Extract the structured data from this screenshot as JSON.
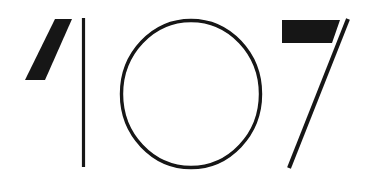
{
  "artwork": {
    "title": "107",
    "kind": "stylized-numeral-graphic",
    "reading": "107",
    "background_color": "#ffffff",
    "ink_color": "#161616",
    "canvas": {
      "width": 368,
      "height": 172
    },
    "glyphs": [
      {
        "character": "1",
        "name": "digit-one",
        "parts": [
          {
            "name": "flag-stroke",
            "shape": "solid-slanted-parallelogram",
            "weight": "thick",
            "points": "72,19 55,19 25,80 45,80",
            "bounds": {
              "x": 25,
              "y": 19,
              "width": 47,
              "height": 61
            }
          },
          {
            "name": "stem-stroke",
            "shape": "vertical-line",
            "weight": "hairline",
            "x": 83.5,
            "y1": 18,
            "y2": 167,
            "stroke_width": 3.2
          }
        ]
      },
      {
        "character": "0",
        "name": "digit-zero",
        "parts": [
          {
            "name": "ring-stroke",
            "shape": "circle-outline",
            "weight": "hairline",
            "cx": 191,
            "cy": 94,
            "rx": 69.5,
            "ry": 73.5,
            "stroke_width": 3.4
          }
        ]
      },
      {
        "character": "7",
        "name": "digit-seven",
        "parts": [
          {
            "name": "top-bar-stroke",
            "shape": "solid-bar-with-slanted-right-edge",
            "weight": "thick",
            "points": "282,20 340,20 332,43 282,43",
            "bounds": {
              "x": 282,
              "y": 20,
              "width": 58,
              "height": 23
            }
          },
          {
            "name": "diagonal-stroke",
            "shape": "diagonal-line",
            "weight": "hairline",
            "x1": 348,
            "y1": 19,
            "x2": 289,
            "y2": 168,
            "stroke_width": 4.0
          }
        ]
      }
    ]
  }
}
